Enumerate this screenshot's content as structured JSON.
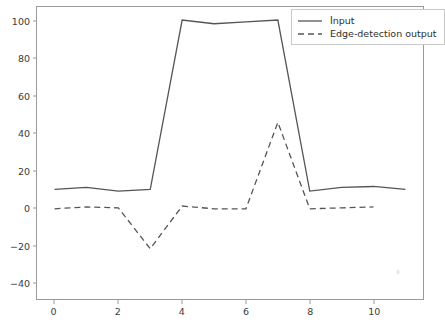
{
  "chart_data": {
    "type": "line",
    "title": "",
    "xlabel": "",
    "ylabel": "",
    "x": [
      0,
      1,
      2,
      3,
      4,
      5,
      6,
      7,
      8,
      9,
      10,
      11
    ],
    "series": [
      {
        "name": "İnput",
        "style": "solid",
        "color": "#555555",
        "values": [
          10,
          11,
          9,
          10,
          101,
          99,
          100,
          101,
          9,
          11,
          11.5,
          10
        ]
      },
      {
        "name": "Edge-detection output",
        "style": "dashed",
        "color": "#555555",
        "values": [
          -0.5,
          0.5,
          0,
          -22,
          1,
          -0.5,
          -0.5,
          46,
          -0.5,
          0,
          0.5,
          null
        ]
      }
    ],
    "xlim": [
      -0.55,
      11.55
    ],
    "ylim": [
      -49,
      108
    ],
    "xticks": [
      "0",
      "2",
      "4",
      "6",
      "8",
      "10"
    ],
    "xtick_values": [
      0,
      2,
      4,
      6,
      8,
      10
    ],
    "yticks": [
      "−40",
      "−20",
      "0",
      "20",
      "40",
      "60",
      "80",
      "100"
    ],
    "ytick_values": [
      -40,
      -20,
      0,
      20,
      40,
      60,
      80,
      100
    ],
    "grid": false,
    "legend_position": "upper right",
    "legend_entries": [
      "İnput",
      "Edge-detection output"
    ]
  },
  "legend": {
    "entry_0_label": "İnput",
    "entry_1_label": "Edge-detection output"
  },
  "artifact": {
    "mark": "↡"
  }
}
